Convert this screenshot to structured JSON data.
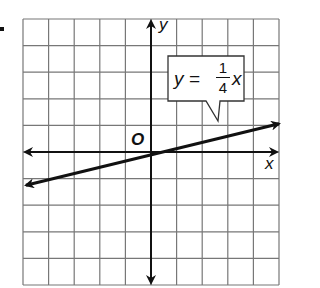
{
  "chart_data": {
    "type": "line",
    "title": "",
    "xlabel": "x",
    "ylabel": "y",
    "origin_label": "O",
    "xlim": [
      -5,
      5
    ],
    "ylim": [
      -5,
      5
    ],
    "grid": true,
    "grid_step": 1,
    "series": [
      {
        "name": "y = 1/4 x",
        "equation": "y = (1/4)x",
        "slope": 0.25,
        "intercept": 0,
        "x": [
          -5,
          0,
          5
        ],
        "y": [
          -1.25,
          0,
          1.25
        ],
        "arrows_both_ends": true
      }
    ],
    "annotations": [
      {
        "text": "y = 1/4 x",
        "type": "callout",
        "points_to": [
          2.8,
          0.7
        ]
      }
    ]
  },
  "labels": {
    "y_axis": "y",
    "x_axis": "x",
    "origin": "O",
    "callout_lhs": "y =",
    "callout_num": "1",
    "callout_den": "4",
    "callout_var": "x"
  }
}
